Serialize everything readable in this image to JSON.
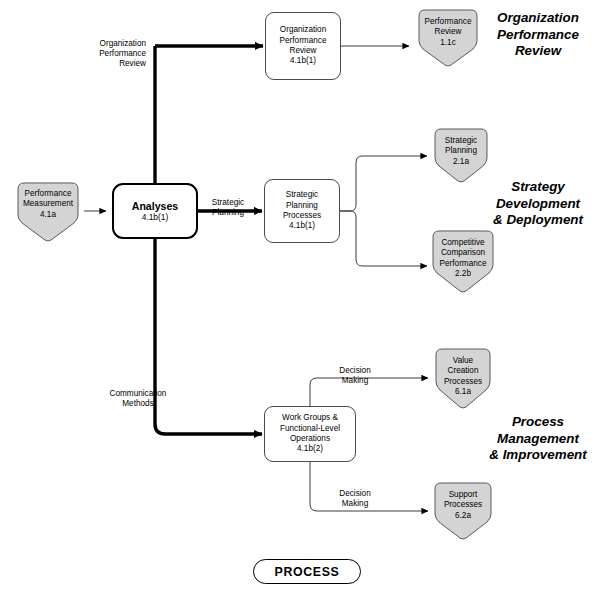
{
  "diagram": {
    "legend_label": "PROCESS",
    "sections": [
      {
        "id": "organization-performance-review",
        "heading": "Organization\nPerformance\nReview"
      },
      {
        "id": "strategy-development-deployment",
        "heading": "Strategy\nDevelopment\n& Deployment"
      },
      {
        "id": "process-management-improvement",
        "heading": "Process\nManagement\n& Improvement"
      }
    ],
    "input_node": {
      "id": "performance-measurement",
      "title": "Performance\nMeasurement",
      "code": "4.1a"
    },
    "hub_node": {
      "id": "analyses",
      "title": "Analyses",
      "code": "4.1b(1)"
    },
    "process_nodes": [
      {
        "id": "organization-performance-review-process",
        "title": "Organization\nPerformance\nReview",
        "code": "4.1b(1)"
      },
      {
        "id": "strategic-planning-processes",
        "title": "Strategic\nPlanning\nProcesses",
        "code": "4.1b(1)"
      },
      {
        "id": "work-groups-functional-level-operations",
        "title": "Work Groups &\nFunctional-Level\nOperations",
        "code": "4.1b(2)"
      }
    ],
    "output_nodes": [
      {
        "id": "performance-review",
        "title": "Performance\nReview",
        "code": "1.1c"
      },
      {
        "id": "strategic-planning",
        "title": "Strategic\nPlanning",
        "code": "2.1a"
      },
      {
        "id": "competitive-comparison-performance",
        "title": "Competitive\nComparison\nPerformance",
        "code": "2.2b"
      },
      {
        "id": "value-creation-processes",
        "title": "Value\nCreation\nProcesses",
        "code": "6.1a"
      },
      {
        "id": "support-processes",
        "title": "Support\nProcesses",
        "code": "6.2a"
      }
    ],
    "flow_labels": [
      {
        "id": "organization-performance-review-flow",
        "text": "Organization\nPerformance\nReview"
      },
      {
        "id": "strategic-planning-flow",
        "text": "Strategic\nPlanning"
      },
      {
        "id": "communication-methods-flow",
        "text": "Communication\nMethods"
      },
      {
        "id": "decision-making-flow-upper",
        "text": "Decision\nMaking"
      },
      {
        "id": "decision-making-flow-lower",
        "text": "Decision\nMaking"
      }
    ],
    "colors": {
      "node_fill": "#d4d4d4",
      "node_stroke": "#5a5a5a",
      "box_stroke": "#4a4a4a",
      "hub_stroke": "#000000",
      "connector": "#000000",
      "background": "#ffffff"
    }
  }
}
